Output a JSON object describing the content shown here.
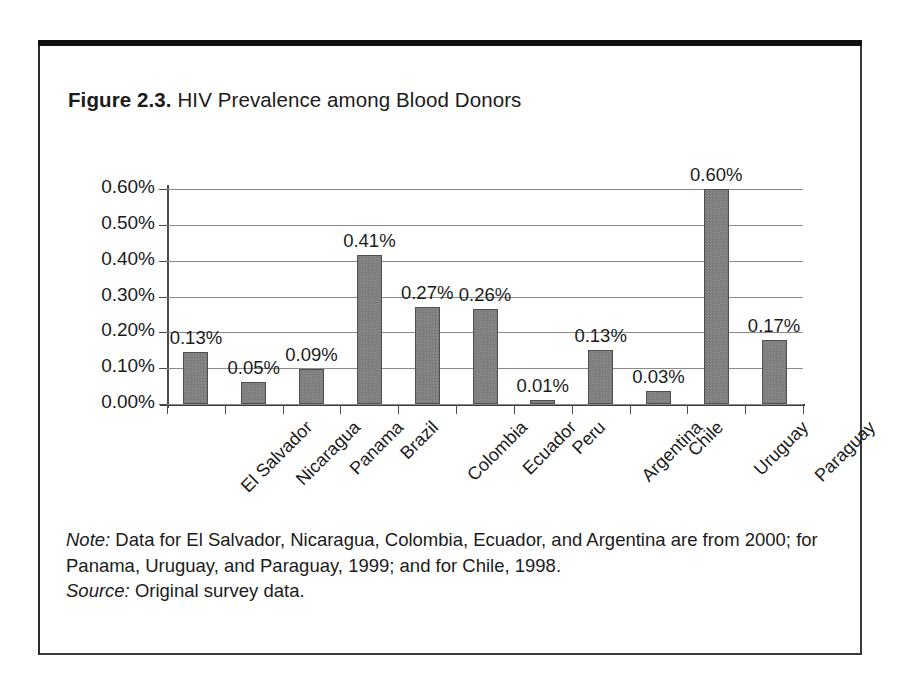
{
  "figure": {
    "number": "Figure 2.3.",
    "title": "HIV Prevalence among Blood Donors",
    "note_lead": "Note:",
    "note_text": " Data for El Salvador, Nicaragua, Colombia, Ecuador, and Argentina are from 2000; for Panama, Uruguay, and Paraguay, 1999; and for Chile, 1998.",
    "source_lead": "Source:",
    "source_text": " Original survey data."
  },
  "colors": {
    "bar_fill": "#808080",
    "bar_outline": "#4f4f4f",
    "gridline": "#8a8a8a",
    "axis": "#4a4a4a",
    "frame": "#3a3a3a",
    "frame_top": "#111111",
    "text": "#1b1b1b",
    "background": "#ffffff"
  },
  "chart_data": {
    "type": "bar",
    "title": "HIV Prevalence among Blood Donors",
    "xlabel": "",
    "ylabel": "",
    "ylim": [
      0,
      0.65
    ],
    "grid": true,
    "legend": "none",
    "y_tick_labels": [
      "0.00%",
      "0.10%",
      "0.20%",
      "0.30%",
      "0.40%",
      "0.50%",
      "0.60%"
    ],
    "y_tick_values": [
      0.0,
      0.1,
      0.2,
      0.3,
      0.4,
      0.5,
      0.6
    ],
    "value_suffix": "%",
    "categories": [
      "El Salvador",
      "Nicaragua",
      "Panama",
      "Brazil",
      "Colombia",
      "Ecuador",
      "Peru",
      "Argentina",
      "Chile",
      "Uruguay",
      "Paraguay"
    ],
    "values": [
      0.13,
      0.05,
      0.09,
      0.41,
      0.27,
      0.26,
      0.01,
      0.13,
      0.03,
      0.6,
      0.17
    ],
    "value_labels": [
      "0.13%",
      "0.05%",
      "0.09%",
      "0.41%",
      "0.27%",
      "0.26%",
      "0.01%",
      "0.13%",
      "0.03%",
      "0.60%",
      "0.17%"
    ],
    "drawn_values": [
      0.145,
      0.062,
      0.097,
      0.415,
      0.272,
      0.265,
      0.012,
      0.152,
      0.035,
      0.6,
      0.18
    ]
  }
}
